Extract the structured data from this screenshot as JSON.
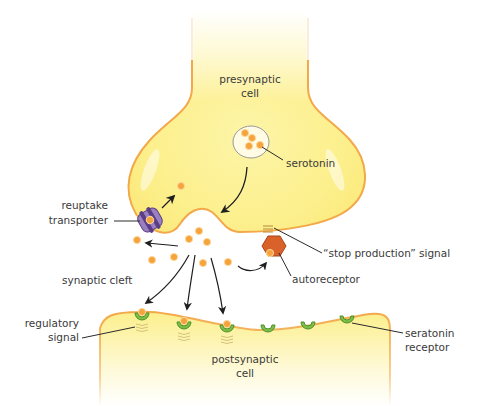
{
  "colors": {
    "cell_fill": "#fdf39a",
    "cell_fill_light": "#fffbe0",
    "membrane": "#f3a84a",
    "serotonin": "#f5a33c",
    "serotonin_stroke": "#ffd79a",
    "transporter": "#8a6db0",
    "transporter_dark": "#5b3f86",
    "autoreceptor": "#d9622a",
    "receptor": "#7cbf45",
    "receptor_dark": "#4f8f2c",
    "arrow": "#1f1f1f",
    "label_text": "#3a3a3a"
  },
  "labels": {
    "presynaptic_line1": "presynaptic",
    "presynaptic_line2": "cell",
    "serotonin": "serotonin",
    "reuptake_line1": "reuptake",
    "reuptake_line2": "transporter",
    "stop_signal": "“stop production” signal",
    "autoreceptor": "autoreceptor",
    "synaptic_cleft": "synaptic cleft",
    "regulatory_line1": "regulatory",
    "regulatory_line2": "signal",
    "postsynaptic_line1": "postsynaptic",
    "postsynaptic_line2": "cell",
    "receptor_line1": "seratonin",
    "receptor_line2": "receptor"
  }
}
